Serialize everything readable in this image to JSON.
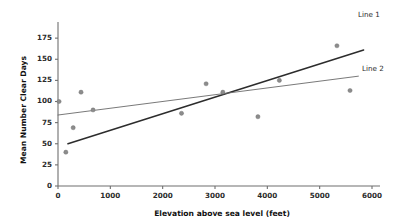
{
  "chart_data": {
    "type": "scatter",
    "title": "",
    "xlabel": "Elevation above sea level (feet)",
    "ylabel": "Mean Number Clear Days",
    "xlim": [
      0,
      6000
    ],
    "ylim": [
      0,
      187
    ],
    "xticks": [
      0,
      1000,
      2000,
      3000,
      4000,
      5000,
      6000
    ],
    "xtick_labels": [
      "0",
      "1000",
      "2000",
      "3000",
      "4000",
      "5000",
      "6000"
    ],
    "yticks": [
      0,
      25,
      50,
      75,
      100,
      125,
      150,
      175
    ],
    "ytick_labels": [
      "0",
      "25",
      "50",
      "75",
      "100",
      "125",
      "150",
      "175"
    ],
    "grid": false,
    "legend_position": "right-outside",
    "points": [
      {
        "x": 20,
        "y": 100
      },
      {
        "x": 150,
        "y": 40
      },
      {
        "x": 290,
        "y": 69
      },
      {
        "x": 440,
        "y": 111
      },
      {
        "x": 670,
        "y": 90
      },
      {
        "x": 2360,
        "y": 86
      },
      {
        "x": 2830,
        "y": 121
      },
      {
        "x": 3150,
        "y": 111
      },
      {
        "x": 3820,
        "y": 82
      },
      {
        "x": 4230,
        "y": 125
      },
      {
        "x": 5330,
        "y": 166
      },
      {
        "x": 5580,
        "y": 113
      }
    ],
    "series": [
      {
        "name": "Line 1",
        "type": "line",
        "color": "#2c2c2c",
        "x": [
          190,
          5840
        ],
        "values": [
          50,
          161
        ]
      },
      {
        "name": "Line 2",
        "type": "line",
        "color": "#6a6a6a",
        "x": [
          0,
          5740
        ],
        "values": [
          84,
          130
        ]
      }
    ],
    "annotations": [
      {
        "name": "Line 1",
        "label": "Line 1"
      },
      {
        "name": "Line 2",
        "label": "Line 2"
      }
    ]
  },
  "labels": {
    "line1": "Line 1",
    "line2": "Line 2",
    "xaxis": "Elevation above sea level (feet)",
    "yaxis": "Mean Number Clear Days"
  }
}
